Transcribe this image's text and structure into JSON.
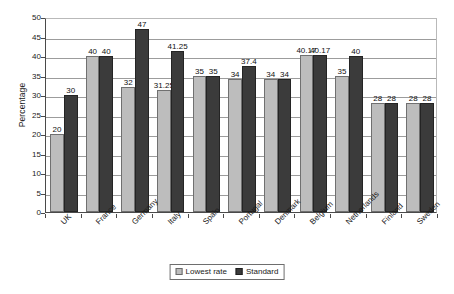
{
  "chart_data": {
    "type": "bar",
    "title": "",
    "xlabel": "",
    "ylabel": "Percentage",
    "ylim": [
      0,
      50
    ],
    "yticks": [
      0,
      5,
      10,
      15,
      20,
      25,
      30,
      35,
      40,
      45,
      50
    ],
    "grid": true,
    "legend_position": "bottom",
    "categories": [
      "UK",
      "France",
      "Germany",
      "Italy",
      "Spain",
      "Portugal",
      "Denmark",
      "Belgium",
      "Netherlands",
      "Finland",
      "Sweden"
    ],
    "series": [
      {
        "name": "Lowest rate",
        "color": "#bdbdbd",
        "values": [
          20,
          40,
          32,
          31.25,
          35,
          34,
          34,
          40.17,
          35,
          28,
          28
        ],
        "labels": [
          "20",
          "40",
          "32",
          "31.25",
          "35",
          "34",
          "34",
          "40.17",
          "35",
          "28",
          "28"
        ]
      },
      {
        "name": "Standard",
        "color": "#3b3b3b",
        "values": [
          30,
          40,
          47,
          41.25,
          35,
          37.4,
          34,
          40.17,
          40,
          28,
          28
        ],
        "labels": [
          "30",
          "40",
          "47",
          "41.25",
          "35",
          "37.4",
          "34",
          "40.17",
          "40",
          "28",
          "28"
        ]
      }
    ]
  },
  "axis": {
    "y_title": "Percentage"
  },
  "legend": {
    "items": [
      {
        "label": "Lowest rate",
        "swatch": "light"
      },
      {
        "label": "Standard",
        "swatch": "dark"
      }
    ]
  }
}
